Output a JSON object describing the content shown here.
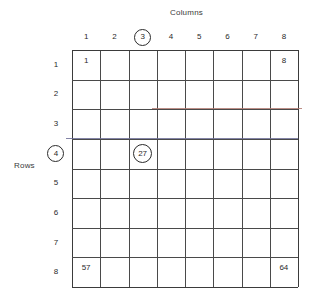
{
  "titles": {
    "columns": "Columns",
    "rows": "Rows"
  },
  "colors": {
    "grid_line": "#4a4a4a",
    "grid_border": "#3b3b3b",
    "text": "#2a2a2a",
    "artifact_red": "#b07a72",
    "artifact_blue": "#6d6f96",
    "background": "#ffffff"
  },
  "chart_data": {
    "type": "table",
    "title": "Columns",
    "xlabel": "Columns",
    "ylabel": "Rows",
    "grid": true,
    "rows": 8,
    "cols": 8,
    "column_headers": [
      "1",
      "2",
      "3",
      "4",
      "5",
      "6",
      "7",
      "8"
    ],
    "row_headers": [
      "1",
      "2",
      "3",
      "4",
      "5",
      "6",
      "7",
      "8"
    ],
    "highlighted_column": "3",
    "highlighted_row": "4",
    "cells": [
      {
        "row": 1,
        "col": 1,
        "value": "1",
        "circled": false
      },
      {
        "row": 1,
        "col": 8,
        "value": "8",
        "circled": false
      },
      {
        "row": 4,
        "col": 3,
        "value": "27",
        "circled": true
      },
      {
        "row": 8,
        "col": 1,
        "value": "57",
        "circled": false
      },
      {
        "row": 8,
        "col": 8,
        "value": "64",
        "circled": false
      }
    ],
    "annotations": [
      {
        "name": "artifact-line-row2-3",
        "color": "#b07a72"
      },
      {
        "name": "artifact-line-row3-4",
        "color": "#6d6f96"
      }
    ]
  }
}
